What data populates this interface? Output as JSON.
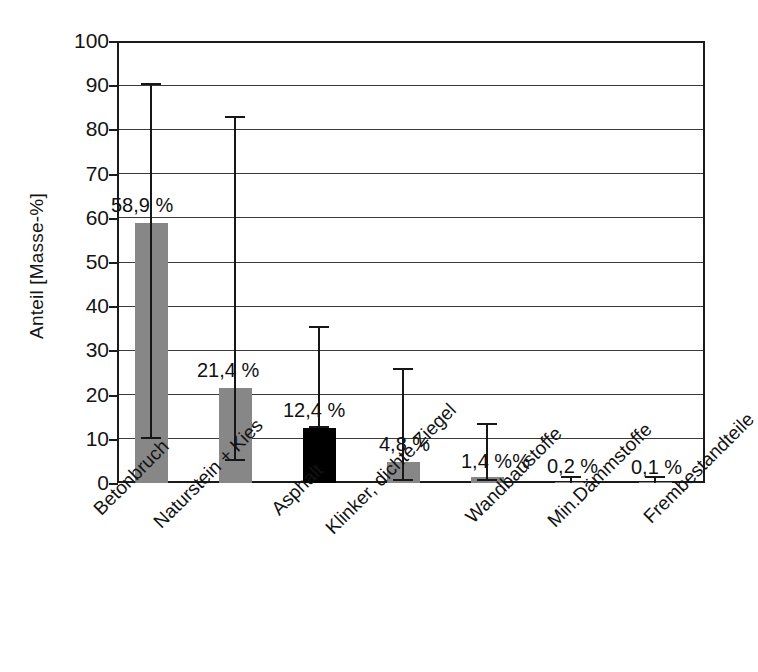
{
  "chart_data": {
    "type": "bar",
    "title": "",
    "subtitle": "",
    "xlabel": "",
    "ylabel": "Anteil [Masse-%]",
    "ylim": [
      0,
      100
    ],
    "ytick_labels": [
      "100",
      "90",
      "80",
      "70",
      "60",
      "50",
      "40",
      "30",
      "20",
      "10",
      "0"
    ],
    "ytick_values": [
      100,
      90,
      80,
      70,
      60,
      50,
      40,
      30,
      20,
      10,
      0
    ],
    "grid": true,
    "grid_axis": "y",
    "legend": "none",
    "categories": [
      "Betonbruch",
      "Naturstein + Kies",
      "Asphalt",
      "Klinker, dichte Ziegel",
      "Wandbaustoffe",
      "Min.Dämmstoffe",
      "Frembestandteile"
    ],
    "values": [
      58.9,
      21.4,
      12.4,
      4.8,
      1.4,
      0.2,
      0.1
    ],
    "data_labels": [
      "58,9 %",
      "21,4 %",
      "12,4 %",
      "4,8 %",
      "1,4 %%",
      "0,2 %",
      "0,1 %"
    ],
    "error_bars": [
      {
        "low": 10.0,
        "high": 90.5
      },
      {
        "low": 5.0,
        "high": 83.0
      },
      {
        "low": 12.4,
        "high": 35.5
      },
      {
        "low": 0.5,
        "high": 26.0
      },
      {
        "low": 0.5,
        "high": 13.5
      },
      {
        "low": 0.0,
        "high": 1.5
      },
      {
        "low": 0.0,
        "high": 1.5
      }
    ],
    "bar_colors": [
      "#878787",
      "#878787",
      "#000000",
      "#878787",
      "#878787",
      "#878787",
      "#878787"
    ],
    "accent_gray": "#878787",
    "accent_black": "#000000",
    "axis_color": "#1b1b1b",
    "grid_color": "#3b3b3b"
  }
}
